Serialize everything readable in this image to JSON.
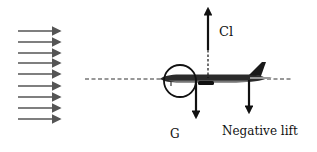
{
  "diagram": {
    "labels": {
      "lift": "Cl",
      "gravity": "G",
      "negative_lift": "Negative lift"
    },
    "airflow": {
      "arrow_count": 9,
      "x_start": 18,
      "x_end": 62,
      "y_positions": [
        31,
        42,
        53,
        63,
        74,
        86,
        97,
        108,
        119
      ],
      "color": "#555555"
    },
    "axis_line": {
      "y": 79,
      "x_start": 85,
      "x_end": 292,
      "style": "dashed",
      "color": "#333333"
    },
    "forces": [
      {
        "name": "Cl",
        "direction": "up",
        "x": 208,
        "y_from": 62,
        "y_to": 5
      },
      {
        "name": "G",
        "direction": "down",
        "x": 196,
        "y_from": 80,
        "y_to": 121
      },
      {
        "name": "Negative lift",
        "direction": "down",
        "x": 249,
        "y_from": 80,
        "y_to": 116
      }
    ],
    "moment_circle": {
      "cx": 180,
      "cy": 81,
      "r": 16
    },
    "colors": {
      "arrow": "#111111",
      "airflow": "#555555",
      "background": "#ffffff"
    }
  }
}
